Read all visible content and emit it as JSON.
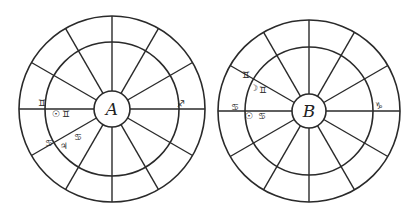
{
  "charts": [
    {
      "id": "A",
      "label": "A",
      "center": [
        112,
        109
      ],
      "outer_radius": 93,
      "inner_radius": 67,
      "hub_radius": 18,
      "house_cusps_deg": [
        0,
        30,
        60,
        90,
        120,
        150,
        180,
        210,
        240,
        270,
        300,
        330
      ],
      "cusp_line_angle_offset_deg": 0,
      "annotations": [
        {
          "glyph": "♊",
          "meaning": "Gemini",
          "x": 42,
          "y": 103
        },
        {
          "glyph": "☉",
          "meaning": "Sun",
          "x": 56,
          "y": 114
        },
        {
          "glyph": "♊",
          "meaning": "Gemini",
          "x": 66,
          "y": 114
        },
        {
          "glyph": "♋",
          "meaning": "Cancer",
          "x": 49,
          "y": 143
        },
        {
          "glyph": "♃",
          "meaning": "Jupiter",
          "x": 64,
          "y": 146
        },
        {
          "glyph": "♋",
          "meaning": "Cancer",
          "x": 78,
          "y": 137
        },
        {
          "glyph": "♐",
          "meaning": "Sagittarius",
          "x": 181,
          "y": 104
        }
      ]
    },
    {
      "id": "B",
      "label": "B",
      "center": [
        309,
        111
      ],
      "outer_radius": 91,
      "inner_radius": 64,
      "hub_radius": 17,
      "house_cusps_deg": [
        0,
        30,
        60,
        90,
        120,
        150,
        180,
        210,
        240,
        270,
        300,
        330
      ],
      "cusp_line_angle_offset_deg": 0,
      "annotations": [
        {
          "glyph": "♊",
          "meaning": "Gemini",
          "x": 246,
          "y": 75
        },
        {
          "glyph": "☽",
          "meaning": "Moon",
          "x": 254,
          "y": 88
        },
        {
          "glyph": "♊",
          "meaning": "Gemini",
          "x": 263,
          "y": 90
        },
        {
          "glyph": "♋",
          "meaning": "Cancer",
          "x": 235,
          "y": 107
        },
        {
          "glyph": "☉",
          "meaning": "Sun",
          "x": 249,
          "y": 116
        },
        {
          "glyph": "♋",
          "meaning": "Cancer",
          "x": 262,
          "y": 116
        },
        {
          "glyph": "♑",
          "meaning": "Capricorn",
          "x": 379,
          "y": 106
        }
      ]
    }
  ],
  "colors": {
    "ink": "#2a2a2a",
    "paper": "#ffffff"
  }
}
